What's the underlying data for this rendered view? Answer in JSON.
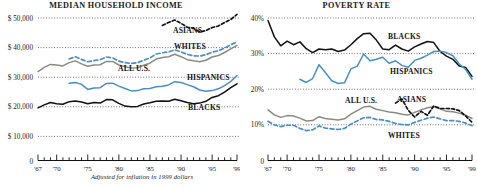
{
  "figure": {
    "footnote": "Adjusted for inflation in 1999 dollars",
    "colors": {
      "black": "#111111",
      "blue": "#4a8fc4",
      "gray": "#8a8a85",
      "grid": "#222222",
      "axis": "#111111"
    }
  },
  "panels": [
    {
      "id": "income",
      "title": "MEDIAN HOUSEHOLD INCOME",
      "ylabels": [
        "$ 50,000",
        "$ 40,000",
        "$ 30,000",
        "$ 20,000",
        "$ 10,000",
        "0"
      ],
      "xlabels": [
        "'67",
        "'70",
        "'75",
        "'80",
        "'85",
        "'90",
        "'95",
        "'99"
      ],
      "series_labels": [
        "ASIANS",
        "WHITES",
        "ALL U.S.",
        "HISPANICS",
        "BLACKS"
      ]
    },
    {
      "id": "poverty",
      "title": "POVERTY RATE",
      "ylabels": [
        "40%",
        "30%",
        "20%",
        "10%",
        "0"
      ],
      "xlabels": [
        "'67",
        "'70",
        "'75",
        "'80",
        "'85",
        "'90",
        "'95",
        "'99"
      ],
      "series_labels": [
        "BLACKS",
        "HISPANICS",
        "ALL U.S.",
        "ASIANS",
        "WHITES"
      ]
    }
  ],
  "chart_data": [
    {
      "type": "line",
      "title": "MEDIAN HOUSEHOLD INCOME",
      "xlabel": "",
      "ylabel": "",
      "note": "Adjusted for inflation in 1999 dollars",
      "xlim": [
        1967,
        1999
      ],
      "ylim": [
        0,
        50000
      ],
      "yticks": [
        0,
        10000,
        20000,
        30000,
        40000,
        50000
      ],
      "ytick_labels": [
        "0",
        "$ 10,000",
        "$ 20,000",
        "$ 30,000",
        "$ 40,000",
        "$ 50,000"
      ],
      "xticks": [
        1967,
        1970,
        1975,
        1980,
        1985,
        1990,
        1995,
        1999
      ],
      "xtick_labels": [
        "'67",
        "'70",
        "'75",
        "'80",
        "'85",
        "'90",
        "'95",
        "'99"
      ],
      "grid": "horizontal-dotted",
      "legend": "inline-labels",
      "x": [
        1967,
        1968,
        1969,
        1970,
        1971,
        1972,
        1973,
        1974,
        1975,
        1976,
        1977,
        1978,
        1979,
        1980,
        1981,
        1982,
        1983,
        1984,
        1985,
        1986,
        1987,
        1988,
        1989,
        1990,
        1991,
        1992,
        1993,
        1994,
        1995,
        1996,
        1997,
        1998,
        1999
      ],
      "series": [
        {
          "name": "ASIANS",
          "color": "#111111",
          "style": "dashed",
          "x": [
            1987,
            1988,
            1989,
            1990,
            1991,
            1992,
            1993,
            1994,
            1995,
            1996,
            1997,
            1998,
            1999
          ],
          "values": [
            47500,
            48500,
            49300,
            48200,
            46900,
            46600,
            45300,
            45800,
            46800,
            47300,
            48500,
            49500,
            51200
          ]
        },
        {
          "name": "WHITES",
          "color": "#4a8fc4",
          "style": "dashed",
          "x": [
            1972,
            1973,
            1974,
            1975,
            1976,
            1977,
            1978,
            1979,
            1980,
            1981,
            1982,
            1983,
            1984,
            1985,
            1986,
            1987,
            1988,
            1989,
            1990,
            1991,
            1992,
            1993,
            1994,
            1995,
            1996,
            1997,
            1998,
            1999
          ],
          "values": [
            36200,
            37000,
            36100,
            35300,
            35700,
            36000,
            36900,
            36600,
            35500,
            35000,
            34700,
            35000,
            35800,
            36600,
            37900,
            38300,
            38600,
            39300,
            38600,
            37800,
            37300,
            37200,
            37700,
            38500,
            39000,
            39900,
            41000,
            42000
          ]
        },
        {
          "name": "ALL U.S.",
          "color": "#8a8a85",
          "style": "solid",
          "x": [
            1967,
            1968,
            1969,
            1970,
            1971,
            1972,
            1973,
            1974,
            1975,
            1976,
            1977,
            1978,
            1979,
            1980,
            1981,
            1982,
            1983,
            1984,
            1985,
            1986,
            1987,
            1988,
            1989,
            1990,
            1991,
            1992,
            1993,
            1994,
            1995,
            1996,
            1997,
            1998,
            1999
          ],
          "values": [
            32000,
            33400,
            34400,
            34200,
            33900,
            35000,
            35600,
            34600,
            33800,
            34200,
            34300,
            35400,
            35400,
            34200,
            33600,
            33200,
            33300,
            34100,
            34800,
            36200,
            36700,
            37000,
            37800,
            37000,
            36000,
            35600,
            35300,
            35800,
            36900,
            37400,
            38400,
            39600,
            40800
          ]
        },
        {
          "name": "HISPANICS",
          "color": "#4a8fc4",
          "style": "solid",
          "x": [
            1972,
            1973,
            1974,
            1975,
            1976,
            1977,
            1978,
            1979,
            1980,
            1981,
            1982,
            1983,
            1984,
            1985,
            1986,
            1987,
            1988,
            1989,
            1990,
            1991,
            1992,
            1993,
            1994,
            1995,
            1996,
            1997,
            1998,
            1999
          ],
          "values": [
            28100,
            28300,
            27700,
            26000,
            26500,
            26600,
            28000,
            28100,
            27100,
            26300,
            25500,
            25600,
            26200,
            26300,
            26900,
            27100,
            27500,
            28600,
            28300,
            27600,
            26900,
            25800,
            25400,
            25600,
            26200,
            27300,
            28700,
            30700
          ]
        },
        {
          "name": "BLACKS",
          "color": "#111111",
          "style": "solid",
          "x": [
            1967,
            1968,
            1969,
            1970,
            1971,
            1972,
            1973,
            1974,
            1975,
            1976,
            1977,
            1978,
            1979,
            1980,
            1981,
            1982,
            1983,
            1984,
            1985,
            1986,
            1987,
            1988,
            1989,
            1990,
            1991,
            1992,
            1993,
            1994,
            1995,
            1996,
            1997,
            1998,
            1999
          ],
          "values": [
            19800,
            20800,
            21600,
            21200,
            21000,
            21900,
            22100,
            21800,
            21200,
            21600,
            21400,
            22600,
            22500,
            21300,
            20400,
            20200,
            20300,
            21100,
            21500,
            22000,
            22100,
            22000,
            22700,
            22200,
            21600,
            21200,
            21400,
            22000,
            23300,
            23900,
            25100,
            26600,
            27900
          ]
        }
      ]
    },
    {
      "type": "line",
      "title": "POVERTY RATE",
      "xlabel": "",
      "ylabel": "",
      "xlim": [
        1967,
        1999
      ],
      "ylim": [
        0,
        40
      ],
      "yticks": [
        0,
        10,
        20,
        30,
        40
      ],
      "ytick_labels": [
        "0",
        "10%",
        "20%",
        "30%",
        "40%"
      ],
      "xticks": [
        1967,
        1970,
        1975,
        1980,
        1985,
        1990,
        1995,
        1999
      ],
      "xtick_labels": [
        "'67",
        "'70",
        "'75",
        "'80",
        "'85",
        "'90",
        "'95",
        "'99"
      ],
      "grid": "horizontal-dotted",
      "legend": "inline-labels",
      "series": [
        {
          "name": "BLACKS",
          "color": "#111111",
          "style": "solid",
          "x": [
            1967,
            1968,
            1969,
            1970,
            1971,
            1972,
            1973,
            1974,
            1975,
            1976,
            1977,
            1978,
            1979,
            1980,
            1981,
            1982,
            1983,
            1984,
            1985,
            1986,
            1987,
            1988,
            1989,
            1990,
            1991,
            1992,
            1993,
            1994,
            1995,
            1996,
            1997,
            1998,
            1999
          ],
          "values": [
            39.3,
            34.7,
            32.2,
            33.5,
            32.5,
            33.3,
            31.4,
            30.3,
            31.3,
            31.1,
            31.3,
            30.6,
            31.0,
            32.5,
            34.2,
            35.6,
            35.7,
            33.8,
            31.3,
            31.1,
            32.4,
            31.3,
            30.7,
            31.9,
            32.7,
            33.4,
            33.1,
            30.6,
            29.3,
            28.4,
            26.5,
            26.1,
            23.6
          ]
        },
        {
          "name": "HISPANICS",
          "color": "#4a8fc4",
          "style": "solid",
          "x": [
            1972,
            1973,
            1974,
            1975,
            1976,
            1977,
            1978,
            1979,
            1980,
            1981,
            1982,
            1983,
            1984,
            1985,
            1986,
            1987,
            1988,
            1989,
            1990,
            1991,
            1992,
            1993,
            1994,
            1995,
            1996,
            1997,
            1998,
            1999
          ],
          "values": [
            22.8,
            21.9,
            23.0,
            26.9,
            24.7,
            22.4,
            21.6,
            21.8,
            25.7,
            26.5,
            29.9,
            28.0,
            28.4,
            29.0,
            27.3,
            28.0,
            26.7,
            26.2,
            28.1,
            28.7,
            29.6,
            30.6,
            30.7,
            30.3,
            29.4,
            27.1,
            25.6,
            22.8
          ]
        },
        {
          "name": "ALL U.S.",
          "color": "#8a8a85",
          "style": "solid",
          "x": [
            1967,
            1968,
            1969,
            1970,
            1971,
            1972,
            1973,
            1974,
            1975,
            1976,
            1977,
            1978,
            1979,
            1980,
            1981,
            1982,
            1983,
            1984,
            1985,
            1986,
            1987,
            1988,
            1989,
            1990,
            1991,
            1992,
            1993,
            1994,
            1995,
            1996,
            1997,
            1998,
            1999
          ],
          "values": [
            14.2,
            12.8,
            12.1,
            12.6,
            12.5,
            11.9,
            11.1,
            11.2,
            12.3,
            11.8,
            11.6,
            11.4,
            11.7,
            13.0,
            14.0,
            15.0,
            15.2,
            14.4,
            14.0,
            13.6,
            13.4,
            13.0,
            12.8,
            13.5,
            14.2,
            14.8,
            15.1,
            14.5,
            13.8,
            13.7,
            13.3,
            12.7,
            11.8
          ]
        },
        {
          "name": "ASIANS",
          "color": "#111111",
          "style": "dashed",
          "x": [
            1987,
            1988,
            1989,
            1990,
            1991,
            1992,
            1993,
            1994,
            1995,
            1996,
            1997,
            1998,
            1999
          ],
          "values": [
            16.1,
            17.3,
            14.1,
            12.2,
            13.8,
            12.7,
            15.3,
            14.6,
            14.6,
            14.5,
            14.0,
            12.5,
            10.7
          ]
        },
        {
          "name": "WHITES",
          "color": "#4a8fc4",
          "style": "dashed",
          "x": [
            1967,
            1968,
            1969,
            1970,
            1971,
            1972,
            1973,
            1974,
            1975,
            1976,
            1977,
            1978,
            1979,
            1980,
            1981,
            1982,
            1983,
            1984,
            1985,
            1986,
            1987,
            1988,
            1989,
            1990,
            1991,
            1992,
            1993,
            1994,
            1995,
            1996,
            1997,
            1998,
            1999
          ],
          "values": [
            11.0,
            10.0,
            9.5,
            9.9,
            9.9,
            9.0,
            8.4,
            8.6,
            9.7,
            9.1,
            8.9,
            8.7,
            9.0,
            10.2,
            11.1,
            12.0,
            12.1,
            11.5,
            11.4,
            11.0,
            10.4,
            10.1,
            10.0,
            10.7,
            11.3,
            11.9,
            12.2,
            11.7,
            11.2,
            11.2,
            11.0,
            10.5,
            9.8
          ]
        }
      ]
    }
  ]
}
